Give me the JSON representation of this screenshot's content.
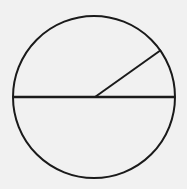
{
  "diagram": {
    "type": "geometry",
    "background": "#f1f1f1",
    "stroke_color": "#1a1a1a",
    "circle": {
      "cx": 94,
      "cy": 97,
      "r": 81
    },
    "diameter": {
      "x1": 13,
      "y1": 97,
      "x2": 175,
      "y2": 97
    },
    "radius": {
      "x1": 95,
      "y1": 97,
      "x2": 161,
      "y2": 50
    },
    "labels": []
  }
}
